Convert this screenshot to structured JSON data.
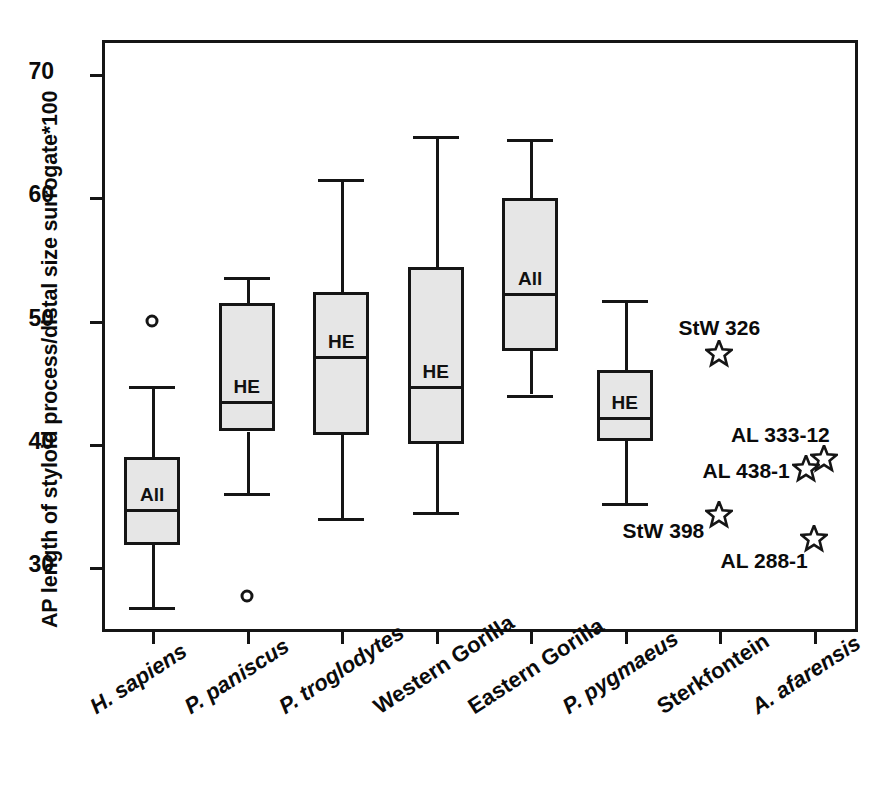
{
  "chart_data": {
    "type": "box",
    "title": "",
    "xlabel": "",
    "ylabel": "AP length of styloid process/distal size surrogate*100",
    "ylim": [
      24.5,
      72.5
    ],
    "yticks": [
      30,
      40,
      50,
      60,
      70
    ],
    "grid": false,
    "legend": "none",
    "categories": [
      "H. sapiens",
      "P. paniscus",
      "P. troglodytes",
      "Western Gorilla",
      "Eastern Gorilla",
      "P. pygmaeus",
      "Sterkfontein",
      "A. afarensis"
    ],
    "boxes": [
      {
        "category": "H. sapiens",
        "tag": "All",
        "whisker_low": 26.8,
        "q1": 31.8,
        "median": 34.7,
        "q3": 38.9,
        "whisker_high": 44.7,
        "outliers": [
          50.0
        ]
      },
      {
        "category": "P. paniscus",
        "tag": "HE",
        "whisker_low": 36.0,
        "q1": 41.0,
        "median": 43.5,
        "q3": 51.4,
        "whisker_high": 53.5,
        "outliers": [
          27.7
        ]
      },
      {
        "category": "P. troglodytes",
        "tag": "HE",
        "whisker_low": 34.0,
        "q1": 40.7,
        "median": 47.1,
        "q3": 52.3,
        "whisker_high": 61.5,
        "outliers": []
      },
      {
        "category": "Western Gorilla",
        "tag": "HE",
        "whisker_low": 34.5,
        "q1": 40.0,
        "median": 44.7,
        "q3": 54.3,
        "whisker_high": 65.0,
        "outliers": []
      },
      {
        "category": "Eastern Gorilla",
        "tag": "All",
        "whisker_low": 44.0,
        "q1": 47.5,
        "median": 52.2,
        "q3": 59.9,
        "whisker_high": 64.7,
        "outliers": []
      },
      {
        "category": "P. pygmaeus",
        "tag": "HE",
        "whisker_low": 35.2,
        "q1": 40.2,
        "median": 42.2,
        "q3": 46.0,
        "whisker_high": 51.7,
        "outliers": []
      }
    ],
    "fossils": [
      {
        "label": "StW 326",
        "category": "Sterkfontein",
        "value": 47.3
      },
      {
        "label": "StW 398",
        "category": "Sterkfontein",
        "value": 34.2
      },
      {
        "label": "AL 333-12",
        "category": "A. afarensis",
        "value": 38.8
      },
      {
        "label": "AL 438-1",
        "category": "A. afarensis",
        "value": 38.0
      },
      {
        "label": "AL 288-1",
        "category": "A. afarensis",
        "value": 32.3
      }
    ],
    "box_tag_legend": {
      "All": "All specimens",
      "HE": "Hyoid-elevated subset"
    }
  },
  "axis": {
    "ytick_labels": [
      "70",
      "60",
      "50",
      "40",
      "30"
    ],
    "ylabel_text": "AP length of styloid process/distal size surrogate*100"
  },
  "xaxis": {
    "labels": [
      {
        "text": "H. sapiens",
        "italic": true
      },
      {
        "text": "P. paniscus",
        "italic": true
      },
      {
        "text": "P. troglodytes",
        "italic": true
      },
      {
        "text": "Western Gorilla",
        "italic": false
      },
      {
        "text": "Eastern Gorilla",
        "italic": false
      },
      {
        "text": "P. pygmaeus",
        "italic": true
      },
      {
        "text": "Sterkfontein",
        "italic": false
      },
      {
        "text": "A. afarensis",
        "italic": true
      }
    ]
  },
  "colors": {
    "box_fill": "#e6e6e6",
    "line": "#151515",
    "text": "#0b0b0b",
    "background": "#ffffff"
  },
  "caption": {
    "text": ""
  }
}
